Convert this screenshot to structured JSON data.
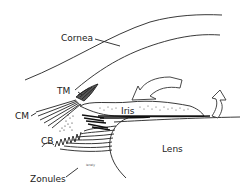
{
  "diagram": {
    "labels": {
      "cornea": "Cornea",
      "tm": "TM",
      "cm": "CM",
      "cb": "CB",
      "iris": "Iris",
      "zonules": "Zonules",
      "lens": "Lens"
    },
    "arrows": [
      {
        "name": "aqueous-flow-arrow-large",
        "direction": "left-curved"
      },
      {
        "name": "aqueous-flow-arrow-pupil",
        "direction": "up-curved"
      }
    ],
    "colors": {
      "ink": "#222222",
      "background": "#ffffff"
    }
  }
}
